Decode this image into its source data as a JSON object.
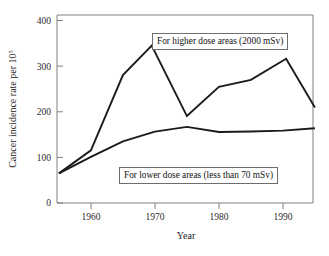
{
  "chart_data": {
    "type": "line",
    "title": "",
    "xlabel": "Year",
    "ylabel": "Cancer incidence rate per 10",
    "ylabel_superscript": "5",
    "xlim": [
      1954.7,
      1994.7
    ],
    "ylim": [
      0,
      400
    ],
    "grid": false,
    "legend_position": "inline-annotations",
    "xticks": [
      1960,
      1970,
      1980,
      1990
    ],
    "xtick_labels": [
      "1960",
      "1970",
      "1980",
      "1990"
    ],
    "yticks": [
      0,
      100,
      200,
      300,
      400
    ],
    "ytick_labels": [
      "0",
      "100",
      "200",
      "300",
      "400"
    ],
    "series": [
      {
        "name": "For higher dose areas (2000 mSv)",
        "x": [
          1955,
          1960,
          1965,
          1969.5,
          1975,
          1980,
          1985,
          1990.5,
          1995
        ],
        "values": [
          63,
          112,
          272,
          335,
          185,
          247,
          262,
          307,
          203
        ]
      },
      {
        "name": "For lower dose areas (less than 70 mSv)",
        "x": [
          1955,
          1960,
          1965,
          1970,
          1975,
          1980,
          1985,
          1990,
          1995
        ],
        "values": [
          63,
          98,
          131,
          152,
          162,
          151,
          152,
          154,
          159
        ]
      }
    ],
    "annotations": [
      {
        "id": "annotation-high",
        "text": "For higher dose areas (2000 mSv)",
        "series": "For higher dose areas (2000 mSv)"
      },
      {
        "id": "annotation-low",
        "text": "For lower dose areas (less than 70 mSv)",
        "series": "For lower dose areas (less than 70 mSv)"
      }
    ],
    "colors": {
      "series_line": "#1b1b1b",
      "axis": "#808080",
      "annotation_border": "#6e6e6e",
      "background": "#ffffff"
    }
  },
  "axes": {
    "x_title": "Year",
    "y_title_main": "Cancer incidence rate per 10",
    "y_title_sup": "5",
    "x_tick_0": "1960",
    "x_tick_1": "1970",
    "x_tick_2": "1980",
    "x_tick_3": "1990",
    "y_tick_0": "0",
    "y_tick_1": "100",
    "y_tick_2": "200",
    "y_tick_3": "300",
    "y_tick_4": "400"
  },
  "annotations": {
    "high_dose": "For higher dose areas (2000 mSv)",
    "low_dose": "For lower dose areas (less than 70 mSv)"
  }
}
